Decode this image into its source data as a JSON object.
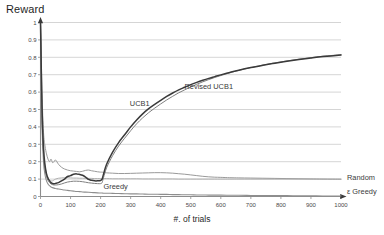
{
  "chart_data": {
    "type": "line",
    "title": "",
    "xlabel": "#. of trials",
    "ylabel": "Reward",
    "xlim": [
      0,
      1000
    ],
    "ylim": [
      0,
      1
    ],
    "grid": true,
    "legend_position": "inline-annotations",
    "xticks": [
      0,
      100,
      200,
      300,
      400,
      500,
      600,
      700,
      800,
      900,
      1000
    ],
    "xtick_labels": [
      "0",
      "100",
      "200",
      "300",
      "400",
      "500",
      "600",
      "700",
      "800",
      "900",
      "1000"
    ],
    "yticks": [
      0,
      0.1,
      0.2,
      0.3,
      0.4,
      0.5,
      0.6,
      0.7,
      0.8,
      0.9,
      1
    ],
    "ytick_labels": [
      "0",
      "0.1",
      "0.2",
      "0.3",
      "0.4",
      "0.5",
      "0.6",
      "0.7",
      "0.8",
      "0.9",
      "1"
    ],
    "annotations": [
      {
        "text": "UCB1",
        "x": 330,
        "y": 0.52
      },
      {
        "text": "Revised  UCB1",
        "x": 560,
        "y": 0.62
      },
      {
        "text": "Greedy",
        "x": 250,
        "y": 0.045
      },
      {
        "text": "Random",
        "x": 1010,
        "y": 0.095
      },
      {
        "text": "ε Greedy",
        "x": 1015,
        "y": 0.013
      }
    ],
    "x": [
      0,
      5,
      10,
      15,
      20,
      25,
      30,
      35,
      40,
      45,
      50,
      60,
      70,
      80,
      90,
      100,
      110,
      120,
      130,
      140,
      150,
      160,
      170,
      180,
      190,
      200,
      205,
      210,
      220,
      240,
      260,
      280,
      300,
      320,
      340,
      360,
      380,
      400,
      420,
      440,
      460,
      480,
      500,
      520,
      540,
      560,
      580,
      600,
      630,
      660,
      700,
      740,
      780,
      820,
      860,
      900,
      940,
      1000
    ],
    "series": [
      {
        "name": "UCB1",
        "color": "#3a3a3a",
        "width": 1.5,
        "values": [
          1.0,
          0.52,
          0.28,
          0.18,
          0.13,
          0.105,
          0.09,
          0.08,
          0.075,
          0.073,
          0.075,
          0.08,
          0.09,
          0.1,
          0.115,
          0.12,
          0.128,
          0.13,
          0.127,
          0.122,
          0.112,
          0.098,
          0.093,
          0.09,
          0.09,
          0.092,
          0.1,
          0.13,
          0.185,
          0.255,
          0.31,
          0.355,
          0.4,
          0.44,
          0.475,
          0.505,
          0.53,
          0.553,
          0.575,
          0.595,
          0.613,
          0.628,
          0.643,
          0.656,
          0.668,
          0.679,
          0.689,
          0.699,
          0.713,
          0.726,
          0.741,
          0.754,
          0.766,
          0.777,
          0.787,
          0.796,
          0.804,
          0.813
        ]
      },
      {
        "name": "Revised UCB1",
        "color": "#808080",
        "width": 1.0,
        "values": [
          1.0,
          0.45,
          0.24,
          0.155,
          0.115,
          0.092,
          0.08,
          0.072,
          0.068,
          0.066,
          0.066,
          0.068,
          0.072,
          0.078,
          0.083,
          0.086,
          0.088,
          0.088,
          0.087,
          0.085,
          0.082,
          0.079,
          0.077,
          0.075,
          0.074,
          0.074,
          0.08,
          0.11,
          0.165,
          0.235,
          0.29,
          0.335,
          0.378,
          0.418,
          0.452,
          0.482,
          0.508,
          0.532,
          0.555,
          0.576,
          0.596,
          0.613,
          0.63,
          0.645,
          0.659,
          0.672,
          0.684,
          0.695,
          0.711,
          0.725,
          0.741,
          0.755,
          0.768,
          0.779,
          0.789,
          0.798,
          0.806,
          0.815
        ]
      },
      {
        "name": "Greedy",
        "color": "#9a9a9a",
        "width": 1.0,
        "values": [
          1.0,
          0.6,
          0.37,
          0.29,
          0.245,
          0.215,
          0.2,
          0.215,
          0.195,
          0.2,
          0.21,
          0.185,
          0.168,
          0.158,
          0.152,
          0.148,
          0.146,
          0.144,
          0.142,
          0.145,
          0.15,
          0.152,
          0.148,
          0.145,
          0.142,
          0.14,
          0.14,
          0.138,
          0.136,
          0.134,
          0.132,
          0.132,
          0.133,
          0.134,
          0.135,
          0.136,
          0.137,
          0.137,
          0.136,
          0.134,
          0.131,
          0.128,
          0.124,
          0.12,
          0.116,
          0.113,
          0.111,
          0.11,
          0.108,
          0.107,
          0.106,
          0.105,
          0.104,
          0.103,
          0.102,
          0.101,
          0.1,
          0.099
        ]
      },
      {
        "name": "Random",
        "color": "#a8a8a8",
        "width": 0.9,
        "values": [
          1.0,
          0.48,
          0.26,
          0.175,
          0.13,
          0.108,
          0.096,
          0.09,
          0.09,
          0.095,
          0.1,
          0.105,
          0.107,
          0.108,
          0.108,
          0.107,
          0.106,
          0.106,
          0.105,
          0.105,
          0.104,
          0.104,
          0.104,
          0.103,
          0.103,
          0.103,
          0.103,
          0.103,
          0.103,
          0.102,
          0.102,
          0.102,
          0.102,
          0.102,
          0.101,
          0.101,
          0.101,
          0.101,
          0.101,
          0.101,
          0.1,
          0.1,
          0.1,
          0.1,
          0.1,
          0.1,
          0.1,
          0.1,
          0.1,
          0.1,
          0.1,
          0.1,
          0.1,
          0.1,
          0.1,
          0.1,
          0.1,
          0.1
        ]
      },
      {
        "name": "ε Greedy",
        "color": "#8e8e8e",
        "width": 1.1,
        "values": [
          1.0,
          0.42,
          0.2,
          0.125,
          0.09,
          0.072,
          0.062,
          0.055,
          0.051,
          0.048,
          0.046,
          0.043,
          0.04,
          0.037,
          0.035,
          0.033,
          0.031,
          0.029,
          0.028,
          0.026,
          0.025,
          0.024,
          0.023,
          0.022,
          0.021,
          0.02,
          0.02,
          0.019,
          0.019,
          0.018,
          0.017,
          0.016,
          0.015,
          0.015,
          0.014,
          0.013,
          0.013,
          0.012,
          0.012,
          0.011,
          0.011,
          0.01,
          0.01,
          0.009,
          0.009,
          0.008,
          0.008,
          0.008,
          0.007,
          0.007,
          0.006,
          0.006,
          0.005,
          0.005,
          0.004,
          0.004,
          0.003,
          0.003
        ]
      }
    ]
  }
}
